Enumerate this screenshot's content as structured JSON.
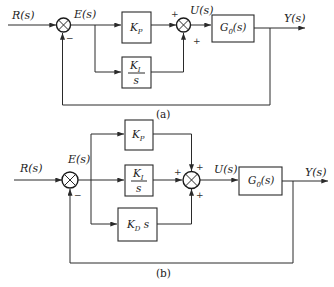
{
  "diagrams": [
    {
      "id": "a",
      "caption": "(a)",
      "controller": "PI",
      "input_label": "R(s)",
      "error_label": "E(s)",
      "control_label": "U(s)",
      "output_label": "Y(s)",
      "blocks": {
        "kp": {
          "main": "K",
          "sub": "P"
        },
        "ki": {
          "num_main": "K",
          "num_sub": "I",
          "den": "s"
        },
        "plant": {
          "main": "G",
          "sub": "0",
          "arg": "(s)"
        }
      },
      "signs": {
        "sum1_feedback": "−",
        "sum2_kp": "+",
        "sum2_ki": "+"
      }
    },
    {
      "id": "b",
      "caption": "(b)",
      "controller": "PID",
      "input_label": "R(s)",
      "error_label": "E(s)",
      "control_label": "U(s)",
      "output_label": "Y(s)",
      "blocks": {
        "kp": {
          "main": "K",
          "sub": "P"
        },
        "ki": {
          "num_main": "K",
          "num_sub": "I",
          "den": "s"
        },
        "kd": {
          "main": "K",
          "sub": "D",
          "tail": " s"
        },
        "plant": {
          "main": "G",
          "sub": "0",
          "arg": "(s)"
        }
      },
      "signs": {
        "sum1_feedback": "−",
        "sum2_kp": "+",
        "sum2_ki": "+",
        "sum2_kd": "+"
      }
    }
  ],
  "colors": {
    "line": "#2a2a2a",
    "background": "#ffffff"
  }
}
